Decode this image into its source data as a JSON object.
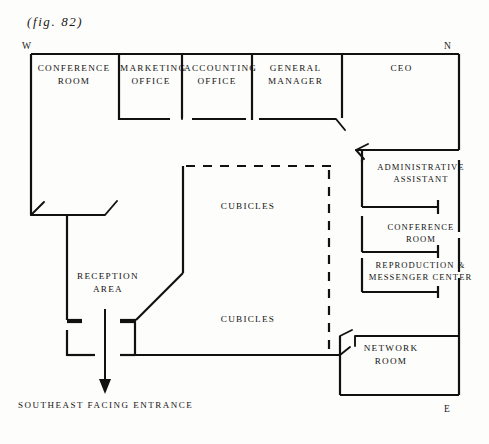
{
  "figure": {
    "caption": "(fig. 82)"
  },
  "compass": {
    "west": "W",
    "north": "N",
    "east": "E"
  },
  "rooms": [
    {
      "id": "conference-room-west",
      "label": "CONFERENCE\nROOM",
      "x": 30,
      "y": 62,
      "w": 88,
      "h": 30
    },
    {
      "id": "marketing-office",
      "label": "MARKETING\nOFFICE",
      "x": 120,
      "y": 62,
      "w": 62,
      "h": 30
    },
    {
      "id": "accounting-office",
      "label": "ACCOUNTING\nOFFICE",
      "x": 184,
      "y": 62,
      "w": 66,
      "h": 30
    },
    {
      "id": "general-manager",
      "label": "GENERAL\nMANAGER",
      "x": 253,
      "y": 62,
      "w": 85,
      "h": 30
    },
    {
      "id": "ceo-office",
      "label": "CEO",
      "x": 344,
      "y": 62,
      "w": 115,
      "h": 16
    },
    {
      "id": "administrative-assistant",
      "label": "ADMINISTRATIVE\nASSISTANT",
      "x": 362,
      "y": 161,
      "w": 118,
      "h": 28
    },
    {
      "id": "conference-room-east",
      "label": "CONFERENCE\nROOM",
      "x": 362,
      "y": 221,
      "w": 118,
      "h": 28
    },
    {
      "id": "reproduction-messenger-center",
      "label": "REPRODUCTION &\nMESSENGER CENTER",
      "x": 358,
      "y": 259,
      "w": 128,
      "h": 28
    },
    {
      "id": "cubicles-upper",
      "label": "CUBICLES",
      "x": 202,
      "y": 200,
      "w": 92,
      "h": 14
    },
    {
      "id": "cubicles-lower",
      "label": "CUBICLES",
      "x": 202,
      "y": 313,
      "w": 92,
      "h": 14
    },
    {
      "id": "reception-area",
      "label": "RECEPTION\nAREA",
      "x": 62,
      "y": 270,
      "w": 92,
      "h": 28
    },
    {
      "id": "network-room",
      "label": "NETWORK\nROOM",
      "x": 345,
      "y": 342,
      "w": 92,
      "h": 28
    }
  ],
  "annotations": {
    "entrance": "SOUTHEAST FACING ENTRANCE"
  },
  "colors": {
    "wall": "#111111",
    "paper": "#fdfdfb",
    "text": "#141414"
  },
  "plan": {
    "wall_stroke_width": 2.2,
    "thin_stroke_width": 1.5,
    "dash_pattern": "9 8"
  }
}
